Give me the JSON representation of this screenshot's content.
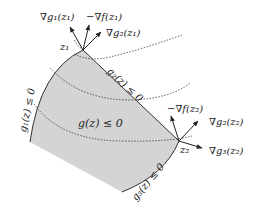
{
  "diagram": {
    "region": {
      "label": "g(z) ≤ 0",
      "fill": "#d4d4d4",
      "stroke": "#333333"
    },
    "points": [
      {
        "id": "z1",
        "label": "z₁"
      },
      {
        "id": "z2",
        "label": "z₂"
      }
    ],
    "constraints": [
      {
        "id": "g1",
        "label": "g₁(z) ≤ 0"
      },
      {
        "id": "g2",
        "label": "g₂(z) ≤ 0"
      },
      {
        "id": "g3",
        "label": "g₃(z) ≤ 0"
      }
    ],
    "vectors": {
      "z1": [
        {
          "label": "∇g₁(z₁)"
        },
        {
          "label": "−∇f(z₁)"
        },
        {
          "label": "∇g₂(z₁)"
        }
      ],
      "z2": [
        {
          "label": "−∇f(z₂)"
        },
        {
          "label": "∇g₂(z₂)"
        },
        {
          "label": "∇g₃(z₂)"
        }
      ]
    },
    "level_curves": {
      "style": "dotted",
      "count": 3
    }
  }
}
